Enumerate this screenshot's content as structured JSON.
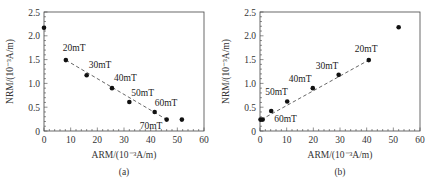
{
  "chart_data": [
    {
      "type": "scatter",
      "panel": "(a)",
      "caption": "(a)",
      "title": "",
      "xlabel": "ARM/(10⁻³A/m)",
      "ylabel": "NRM/(10⁻³A/m)",
      "xlim": [
        0,
        60
      ],
      "ylim": [
        0,
        2.5
      ],
      "xticks": [
        "0",
        "10",
        "20",
        "30",
        "40",
        "50",
        "60"
      ],
      "yticks": [
        "0",
        "0.5",
        "1.0",
        "1.5",
        "2.0",
        "2.5"
      ],
      "grid": false,
      "points": [
        {
          "x": 0,
          "y": 2.17,
          "label": ""
        },
        {
          "x": 8.2,
          "y": 1.49,
          "label": "20mT"
        },
        {
          "x": 16,
          "y": 1.17,
          "label": "30mT"
        },
        {
          "x": 25.5,
          "y": 0.9,
          "label": "40mT"
        },
        {
          "x": 32,
          "y": 0.61,
          "label": "50mT"
        },
        {
          "x": 41.5,
          "y": 0.4,
          "label": "60mT"
        },
        {
          "x": 46,
          "y": 0.24,
          "label": "70mT"
        },
        {
          "x": 51.7,
          "y": 0.24,
          "label": ""
        }
      ],
      "fit_line": {
        "style": "dashed",
        "from": [
          8.2,
          1.49
        ],
        "to": [
          46,
          0.24
        ]
      }
    },
    {
      "type": "scatter",
      "panel": "(b)",
      "caption": "(b)",
      "title": "",
      "xlabel": "ARM/(10⁻³A/m)",
      "ylabel": "NRM/(10⁻³A/m)",
      "xlim": [
        0,
        60
      ],
      "ylim": [
        0,
        2.5
      ],
      "xticks": [
        "0",
        "10",
        "20",
        "30",
        "40",
        "50",
        "60"
      ],
      "yticks": [
        "0",
        "0.5",
        "1.0",
        "1.5",
        "2.0",
        "2.5"
      ],
      "grid": false,
      "points": [
        {
          "x": 0.2,
          "y": 0.24,
          "label": ""
        },
        {
          "x": 1.0,
          "y": 0.24,
          "label": ""
        },
        {
          "x": 4.2,
          "y": 0.42,
          "label": "60mT"
        },
        {
          "x": 10.2,
          "y": 0.62,
          "label": "50mT"
        },
        {
          "x": 19.8,
          "y": 0.9,
          "label": "40mT"
        },
        {
          "x": 29.5,
          "y": 1.18,
          "label": "30mT"
        },
        {
          "x": 40.8,
          "y": 1.49,
          "label": "20mT"
        },
        {
          "x": 52,
          "y": 2.18,
          "label": ""
        }
      ],
      "fit_line": {
        "style": "dashed",
        "from": [
          0.5,
          0.24
        ],
        "to": [
          40.8,
          1.49
        ]
      }
    }
  ],
  "colors": {
    "axis": "#444444",
    "point": "#111111",
    "line": "#555555"
  }
}
